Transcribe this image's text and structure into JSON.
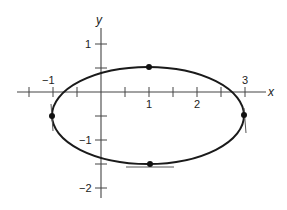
{
  "figure": {
    "axes": {
      "x_label": "x",
      "y_label": "y",
      "x_tick_labels": [
        "−1",
        "1",
        "2",
        "3"
      ],
      "y_tick_labels": [
        "1",
        "−1",
        "−2"
      ],
      "x_range": [
        -1.75,
        3.5
      ],
      "y_range": [
        -2.2,
        1.35
      ],
      "tick_spacing": 0.5
    },
    "curve": {
      "type": "ellipse",
      "center": [
        1,
        -0.5
      ],
      "semi_axis_x": 2,
      "semi_axis_y": 1,
      "stroke_color": "#1a1a1a"
    },
    "marked_points": [
      {
        "name": "top",
        "x": 1,
        "y": 0.5,
        "tangent": "horizontal"
      },
      {
        "name": "bottom",
        "x": 1,
        "y": -1.5,
        "tangent": "horizontal"
      },
      {
        "name": "left",
        "x": -1,
        "y": -0.5,
        "tangent": "vertical"
      },
      {
        "name": "right",
        "x": 3,
        "y": -0.5,
        "tangent": "vertical"
      }
    ],
    "colors": {
      "axis": "#444444",
      "curve": "#1a1a1a",
      "points": "#111111",
      "background": "#ffffff"
    }
  }
}
